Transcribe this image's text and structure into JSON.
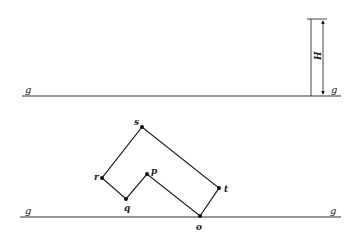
{
  "diagram": {
    "ground_labels": {
      "top_left": "g",
      "top_right": "g",
      "bottom_left": "g",
      "bottom_right": "g"
    },
    "dimension_label": "H",
    "points": {
      "s": {
        "label": "s",
        "x": 142,
        "y": 127
      },
      "r": {
        "label": "r",
        "x": 102,
        "y": 178
      },
      "q": {
        "label": "q",
        "x": 126,
        "y": 199
      },
      "p": {
        "label": "p",
        "x": 147,
        "y": 174
      },
      "t": {
        "label": "t",
        "x": 219,
        "y": 188
      },
      "o": {
        "label": "o",
        "x": 200,
        "y": 216
      }
    },
    "polygon_order": [
      "o",
      "t",
      "s",
      "r",
      "q",
      "p"
    ],
    "colors": {
      "line": "#1a1a1a",
      "ground": "#333333",
      "background": "#ffffff"
    }
  }
}
